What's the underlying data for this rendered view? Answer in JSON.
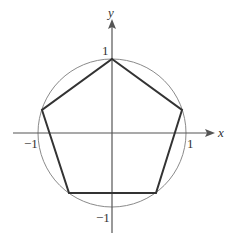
{
  "diagram": {
    "type": "regular pentagon inscribed in unit circle",
    "axes": {
      "x_label": "x",
      "y_label": "y",
      "x_ticks": [
        {
          "value": -1,
          "label": "−1"
        },
        {
          "value": 1,
          "label": "1"
        }
      ],
      "y_ticks": [
        {
          "value": 1,
          "label": "1"
        },
        {
          "value": -1,
          "label": "−1"
        }
      ]
    },
    "circle": {
      "center": [
        0,
        0
      ],
      "radius": 1
    },
    "pentagon_vertices": [
      [
        0,
        1
      ],
      [
        0.951,
        0.309
      ],
      [
        0.588,
        -0.809
      ],
      [
        -0.588,
        -0.809
      ],
      [
        -0.951,
        0.309
      ]
    ],
    "colors": {
      "axes": "#555555",
      "circle": "#888888",
      "pentagon": "#333333"
    }
  }
}
